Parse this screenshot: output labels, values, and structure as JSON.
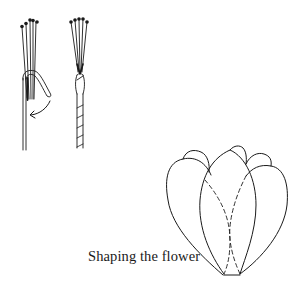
{
  "figure": {
    "caption": "Shaping the flower",
    "line_color": "#1a1a1a",
    "background": "#ffffff",
    "panels": [
      {
        "name": "stamens-hooked-wire",
        "description": "Bundle of stamen threads with a wire bent into a hook over them; curved arrow indicates folding down"
      },
      {
        "name": "stamens-taped-stem",
        "description": "Stamen bundle bound to the wire and stem wrapped with tape"
      },
      {
        "name": "flower-petals",
        "description": "Closed tulip-like flower of overlapping petals; dashed lines show hidden petal edges"
      }
    ]
  }
}
